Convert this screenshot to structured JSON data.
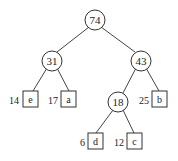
{
  "tree": {
    "internal_nodes": [
      {
        "id": "root",
        "value": "74"
      },
      {
        "id": "n31",
        "value": "31"
      },
      {
        "id": "n43",
        "value": "43"
      },
      {
        "id": "n18",
        "value": "18"
      }
    ],
    "leaves": [
      {
        "id": "e",
        "symbol": "e",
        "weight": "14"
      },
      {
        "id": "a",
        "symbol": "a",
        "weight": "17"
      },
      {
        "id": "b",
        "symbol": "b",
        "weight": "25"
      },
      {
        "id": "d",
        "symbol": "d",
        "weight": "6"
      },
      {
        "id": "c",
        "symbol": "c",
        "weight": "12"
      }
    ]
  }
}
